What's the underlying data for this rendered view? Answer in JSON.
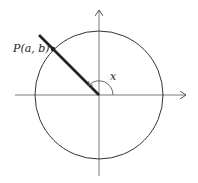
{
  "diagram": {
    "type": "unit-circle-angle",
    "labels": {
      "point": "P(a, b)",
      "angle": "x"
    },
    "colors": {
      "stroke": "#333333",
      "background": "#ffffff"
    }
  }
}
